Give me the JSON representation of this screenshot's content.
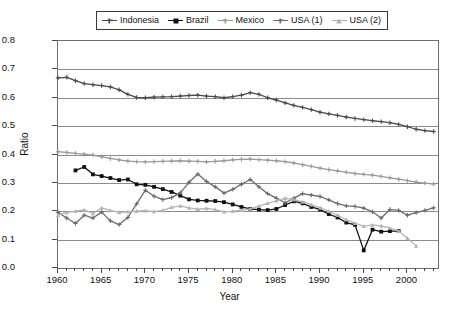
{
  "chart_data": {
    "type": "line",
    "title": "",
    "xlabel": "Year",
    "ylabel": "Ratio",
    "xlim": [
      1960,
      2003.5
    ],
    "ylim": [
      0.0,
      0.8
    ],
    "grid": "horizontal",
    "legend_position": "top-center",
    "ytick_labels": [
      "0.0",
      "0.1",
      "0.2",
      "0.3",
      "0.4",
      "0.5",
      "0.6",
      "0.7",
      "0.8"
    ],
    "ytick_values": [
      0.0,
      0.1,
      0.2,
      0.3,
      0.4,
      0.5,
      0.6,
      0.7,
      0.8
    ],
    "xtick_labels": [
      "1960",
      "1965",
      "1970",
      "1975",
      "1980",
      "1985",
      "1990",
      "1995",
      "2000"
    ],
    "xtick_values": [
      1960,
      1965,
      1970,
      1975,
      1980,
      1985,
      1990,
      1995,
      2000
    ],
    "xtick_minor_step": 1,
    "series": [
      {
        "name": "Indonesia",
        "color": "#4a4a4a",
        "marker": "plus",
        "x": [
          1960,
          1961,
          1962,
          1963,
          1964,
          1965,
          1966,
          1967,
          1968,
          1969,
          1970,
          1971,
          1972,
          1973,
          1974,
          1975,
          1976,
          1977,
          1978,
          1979,
          1980,
          1981,
          1982,
          1983,
          1984,
          1985,
          1986,
          1987,
          1988,
          1989,
          1990,
          1991,
          1992,
          1993,
          1994,
          1995,
          1996,
          1997,
          1998,
          1999,
          2000,
          2001,
          2002,
          2003
        ],
        "values": [
          0.67,
          0.672,
          0.66,
          0.65,
          0.646,
          0.643,
          0.638,
          0.628,
          0.612,
          0.601,
          0.6,
          0.602,
          0.603,
          0.604,
          0.606,
          0.608,
          0.609,
          0.606,
          0.604,
          0.6,
          0.604,
          0.609,
          0.618,
          0.612,
          0.6,
          0.592,
          0.582,
          0.573,
          0.566,
          0.558,
          0.549,
          0.543,
          0.538,
          0.532,
          0.527,
          0.523,
          0.519,
          0.516,
          0.512,
          0.506,
          0.498,
          0.489,
          0.484,
          0.481
        ]
      },
      {
        "name": "Brazil",
        "color": "#111111",
        "marker": "square",
        "x": [
          1962,
          1963,
          1964,
          1965,
          1966,
          1967,
          1968,
          1969,
          1970,
          1971,
          1972,
          1973,
          1974,
          1975,
          1976,
          1977,
          1978,
          1979,
          1980,
          1981,
          1982,
          1983,
          1984,
          1985,
          1986,
          1987,
          1988,
          1989,
          1990,
          1991,
          1992,
          1993,
          1994,
          1995,
          1996,
          1997,
          1998,
          1999
        ],
        "values": [
          0.344,
          0.356,
          0.33,
          0.324,
          0.317,
          0.31,
          0.312,
          0.295,
          0.293,
          0.286,
          0.278,
          0.268,
          0.255,
          0.242,
          0.238,
          0.237,
          0.236,
          0.232,
          0.224,
          0.215,
          0.208,
          0.206,
          0.204,
          0.208,
          0.222,
          0.235,
          0.228,
          0.215,
          0.206,
          0.19,
          0.178,
          0.16,
          0.152,
          0.062,
          0.135,
          0.128,
          0.13,
          0.13
        ]
      },
      {
        "name": "Mexico",
        "color": "#9a9a9a",
        "marker": "cross",
        "x": [
          1960,
          1961,
          1962,
          1963,
          1964,
          1965,
          1966,
          1967,
          1968,
          1969,
          1970,
          1971,
          1972,
          1973,
          1974,
          1975,
          1976,
          1977,
          1978,
          1979,
          1980,
          1981,
          1982,
          1983,
          1984,
          1985,
          1986,
          1987,
          1988,
          1989,
          1990,
          1991,
          1992,
          1993,
          1994,
          1995,
          1996,
          1997,
          1998,
          1999,
          2000,
          2001,
          2002,
          2003
        ],
        "values": [
          0.41,
          0.407,
          0.404,
          0.401,
          0.398,
          0.392,
          0.386,
          0.381,
          0.377,
          0.375,
          0.374,
          0.375,
          0.376,
          0.377,
          0.378,
          0.377,
          0.376,
          0.374,
          0.376,
          0.378,
          0.381,
          0.383,
          0.384,
          0.382,
          0.38,
          0.378,
          0.375,
          0.37,
          0.364,
          0.358,
          0.352,
          0.347,
          0.342,
          0.337,
          0.333,
          0.33,
          0.327,
          0.323,
          0.318,
          0.313,
          0.308,
          0.303,
          0.299,
          0.296
        ]
      },
      {
        "name": "USA (1)",
        "color": "#6b6b6b",
        "marker": "plus",
        "x": [
          1960,
          1961,
          1962,
          1963,
          1964,
          1965,
          1966,
          1967,
          1968,
          1969,
          1970,
          1971,
          1972,
          1973,
          1974,
          1975,
          1976,
          1977,
          1978,
          1979,
          1980,
          1981,
          1982,
          1983,
          1984,
          1985,
          1986,
          1987,
          1988,
          1989,
          1990,
          1991,
          1992,
          1993,
          1994,
          1995,
          1996,
          1997,
          1998,
          1999,
          2000,
          2001,
          2002,
          2003
        ],
        "values": [
          0.196,
          0.176,
          0.157,
          0.186,
          0.176,
          0.197,
          0.166,
          0.153,
          0.178,
          0.226,
          0.274,
          0.253,
          0.241,
          0.248,
          0.265,
          0.302,
          0.331,
          0.305,
          0.286,
          0.264,
          0.277,
          0.295,
          0.312,
          0.286,
          0.262,
          0.246,
          0.23,
          0.246,
          0.262,
          0.257,
          0.252,
          0.24,
          0.227,
          0.219,
          0.217,
          0.211,
          0.198,
          0.176,
          0.206,
          0.203,
          0.186,
          0.195,
          0.203,
          0.212
        ]
      },
      {
        "name": "USA (2)",
        "color": "#b4b4b4",
        "marker": "triangle",
        "x": [
          1960,
          1961,
          1962,
          1963,
          1964,
          1965,
          1966,
          1967,
          1968,
          1969,
          1970,
          1971,
          1972,
          1973,
          1974,
          1975,
          1976,
          1977,
          1978,
          1979,
          1980,
          1981,
          1982,
          1983,
          1984,
          1985,
          1986,
          1987,
          1988,
          1989,
          1990,
          1991,
          1992,
          1993,
          1994,
          1995,
          1996,
          1997,
          1998,
          1999,
          2000,
          2001
        ],
        "values": [
          0.186,
          0.196,
          0.2,
          0.205,
          0.192,
          0.212,
          0.203,
          0.196,
          0.198,
          0.2,
          0.202,
          0.199,
          0.203,
          0.214,
          0.219,
          0.212,
          0.207,
          0.21,
          0.206,
          0.198,
          0.2,
          0.204,
          0.208,
          0.218,
          0.228,
          0.237,
          0.246,
          0.241,
          0.233,
          0.223,
          0.212,
          0.2,
          0.186,
          0.17,
          0.158,
          0.147,
          0.152,
          0.148,
          0.141,
          0.13,
          0.105,
          0.078
        ]
      }
    ]
  },
  "legend": {
    "entries": [
      {
        "label": "Indonesia"
      },
      {
        "label": "Brazil"
      },
      {
        "label": "Mexico"
      },
      {
        "label": "USA (1)"
      },
      {
        "label": "USA (2)"
      }
    ]
  }
}
